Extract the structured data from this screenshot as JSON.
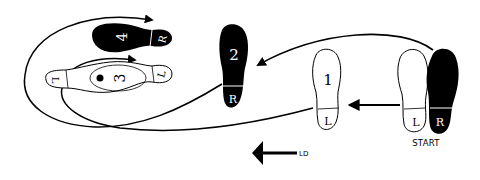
{
  "diagram": {
    "type": "dance-footwork",
    "colors": {
      "ink": "#000000",
      "paper": "#ffffff"
    },
    "start_label": "START",
    "direction_label": "LD",
    "steps": [
      {
        "id": "start-left",
        "number": "",
        "foot": "L",
        "weight": "open",
        "note": "starting position"
      },
      {
        "id": "start-right",
        "number": "",
        "foot": "R",
        "weight": "filled",
        "note": "starting position"
      },
      {
        "id": "step-1",
        "number": "1",
        "foot": "L",
        "weight": "open"
      },
      {
        "id": "step-2",
        "number": "2",
        "foot": "R",
        "weight": "filled"
      },
      {
        "id": "step-3",
        "number": "3",
        "foot": "L",
        "weight": "open",
        "marker": "dot",
        "orientation": "turned"
      },
      {
        "id": "step-4",
        "number": "4",
        "foot": "R",
        "weight": "filled",
        "orientation": "turned"
      }
    ]
  }
}
